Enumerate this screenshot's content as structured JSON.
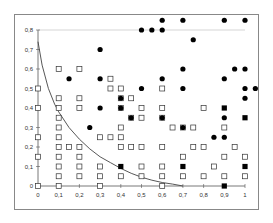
{
  "chart_data": {
    "type": "scatter",
    "title": "",
    "xlabel": "",
    "ylabel": "",
    "xlim": [
      0,
      1
    ],
    "ylim": [
      0,
      0.8
    ],
    "grid": false,
    "x_ticks": [
      "0",
      "0,1",
      "0,2",
      "0,3",
      "0,4",
      "0,5",
      "0,6",
      "0,7",
      "0,8",
      "0,9",
      "1"
    ],
    "y_ticks": [
      "0",
      "0,1",
      "0,2",
      "0,3",
      "0,4",
      "0,5",
      "0,6",
      "0,7",
      "0,8"
    ],
    "reference_line_y": 0.8,
    "curve": {
      "name": "boundary-curve",
      "points": [
        [
          0.0,
          0.74
        ],
        [
          0.02,
          0.62
        ],
        [
          0.05,
          0.5
        ],
        [
          0.08,
          0.42
        ],
        [
          0.1,
          0.38
        ],
        [
          0.15,
          0.3
        ],
        [
          0.2,
          0.24
        ],
        [
          0.25,
          0.19
        ],
        [
          0.3,
          0.15
        ],
        [
          0.35,
          0.12
        ],
        [
          0.4,
          0.09
        ],
        [
          0.45,
          0.065
        ],
        [
          0.5,
          0.045
        ],
        [
          0.55,
          0.03
        ],
        [
          0.6,
          0.018
        ],
        [
          0.65,
          0.01
        ],
        [
          0.7,
          0.0
        ]
      ]
    },
    "series": [
      {
        "name": "open-squares",
        "marker": "open-square",
        "color": "#333333",
        "points": [
          [
            0,
            0.5
          ],
          [
            0,
            0.4
          ],
          [
            0,
            0.25
          ],
          [
            0,
            0.15
          ],
          [
            0,
            0
          ],
          [
            0.1,
            0.6
          ],
          [
            0.1,
            0.45
          ],
          [
            0.1,
            0.4
          ],
          [
            0.1,
            0.35
          ],
          [
            0.1,
            0.3
          ],
          [
            0.1,
            0.25
          ],
          [
            0.1,
            0.2
          ],
          [
            0.1,
            0.15
          ],
          [
            0.1,
            0.1
          ],
          [
            0.1,
            0.05
          ],
          [
            0.1,
            0
          ],
          [
            0.15,
            0.2
          ],
          [
            0.2,
            0.6
          ],
          [
            0.2,
            0.45
          ],
          [
            0.2,
            0.4
          ],
          [
            0.2,
            0.2
          ],
          [
            0.2,
            0.15
          ],
          [
            0.2,
            0.1
          ],
          [
            0.2,
            0.05
          ],
          [
            0.3,
            0.25
          ],
          [
            0.3,
            0.1
          ],
          [
            0.3,
            0.05
          ],
          [
            0.3,
            0
          ],
          [
            0.35,
            0.55
          ],
          [
            0.35,
            0.5
          ],
          [
            0.35,
            0.25
          ],
          [
            0.4,
            0.5
          ],
          [
            0.4,
            0.45
          ],
          [
            0.4,
            0.4
          ],
          [
            0.4,
            0.3
          ],
          [
            0.4,
            0.25
          ],
          [
            0.4,
            0.2
          ],
          [
            0.4,
            0.05
          ],
          [
            0.45,
            0.45
          ],
          [
            0.45,
            0.35
          ],
          [
            0.45,
            0.2
          ],
          [
            0.5,
            0.4
          ],
          [
            0.5,
            0.35
          ],
          [
            0.5,
            0.2
          ],
          [
            0.5,
            0.1
          ],
          [
            0.5,
            0.05
          ],
          [
            0.6,
            0.5
          ],
          [
            0.6,
            0.4
          ],
          [
            0.6,
            0.35
          ],
          [
            0.6,
            0.2
          ],
          [
            0.6,
            0.1
          ],
          [
            0.6,
            0.05
          ],
          [
            0.6,
            0
          ],
          [
            0.65,
            0.3
          ],
          [
            0.7,
            0.3
          ],
          [
            0.7,
            0.15
          ],
          [
            0.7,
            0.05
          ],
          [
            0.75,
            0.3
          ],
          [
            0.75,
            0.2
          ],
          [
            0.8,
            0.4
          ],
          [
            0.8,
            0.2
          ],
          [
            0.8,
            0.05
          ],
          [
            0.85,
            0.1
          ],
          [
            0.9,
            0.3
          ],
          [
            0.9,
            0.15
          ],
          [
            0.9,
            0.05
          ],
          [
            0.95,
            0.2
          ],
          [
            1.0,
            0.15
          ],
          [
            1.0,
            0.05
          ]
        ]
      },
      {
        "name": "filled-circles",
        "marker": "filled-circle",
        "color": "#000000",
        "points": [
          [
            0.6,
            0.85
          ],
          [
            0.7,
            0.85
          ],
          [
            0.9,
            0.85
          ],
          [
            1.0,
            0.85
          ],
          [
            0.5,
            0.8
          ],
          [
            0.55,
            0.8
          ],
          [
            0.6,
            0.8
          ],
          [
            0.75,
            0.75
          ],
          [
            0.3,
            0.7
          ],
          [
            0.7,
            0.6
          ],
          [
            0.95,
            0.6
          ],
          [
            1.0,
            0.6
          ],
          [
            0.15,
            0.55
          ],
          [
            0.3,
            0.55
          ],
          [
            0.6,
            0.55
          ],
          [
            0.9,
            0.55
          ],
          [
            0.5,
            0.5
          ],
          [
            0.7,
            0.5
          ],
          [
            1.0,
            0.5
          ],
          [
            1.05,
            0.5
          ],
          [
            0.4,
            0.45
          ],
          [
            1.0,
            0.45
          ],
          [
            0.45,
            0.35
          ],
          [
            0.6,
            0.35
          ],
          [
            0.9,
            0.35
          ],
          [
            0.25,
            0.3
          ],
          [
            0.7,
            0.3
          ],
          [
            0.85,
            0.25
          ],
          [
            0.9,
            0.25
          ],
          [
            0.3,
            0.4
          ],
          [
            0.4,
            0.4
          ]
        ]
      },
      {
        "name": "filled-squares",
        "marker": "filled-square",
        "color": "#000000",
        "points": [
          [
            0.4,
            0.1
          ],
          [
            0.7,
            0.1
          ],
          [
            0.9,
            0.4
          ],
          [
            1.0,
            0.35
          ],
          [
            1.0,
            0.1
          ],
          [
            0.9,
            0
          ]
        ]
      }
    ]
  }
}
